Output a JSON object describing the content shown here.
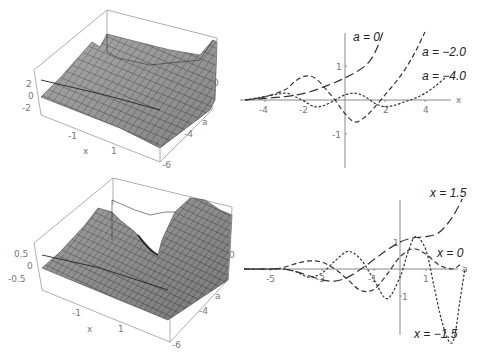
{
  "chart_data": [
    {
      "type": "surface",
      "title": "",
      "position": "top-left",
      "xlabel": "x",
      "ylabel": "a",
      "x_ticks": [
        "-1",
        "1"
      ],
      "a_ticks": [
        "0",
        "-2",
        "-4",
        "-6"
      ],
      "z_ticks": [
        "2",
        "0",
        "-2"
      ]
    },
    {
      "type": "line",
      "title": "",
      "position": "top-right",
      "xlabel": "x",
      "ylabel": "",
      "x_ticks": [
        "-4",
        "-2",
        "2",
        "4"
      ],
      "y_ticks": [
        "1",
        "-1"
      ],
      "xlim": [
        -5,
        5
      ],
      "ylim": [
        -1.9,
        2.0
      ],
      "series": [
        {
          "name": "a = 0",
          "style": "long-dash",
          "x": [
            -5,
            -4,
            -3,
            -2,
            -1,
            0,
            1,
            1.5,
            1.9
          ],
          "y": [
            0,
            0.05,
            0.1,
            0.2,
            0.4,
            0.65,
            1.0,
            1.4,
            2.0
          ]
        },
        {
          "name": "a = −2.0",
          "style": "medium-dash",
          "x": [
            -5,
            -4,
            -3,
            -2.5,
            -2,
            -1.5,
            -1,
            -0.5,
            0,
            0.5,
            1,
            1.5,
            2,
            2.5,
            3,
            3.5,
            4
          ],
          "y": [
            0,
            0.1,
            0.3,
            0.55,
            0.7,
            0.65,
            0.35,
            0,
            -0.4,
            -0.65,
            -0.5,
            -0.2,
            0.15,
            0.5,
            0.9,
            1.4,
            2.0
          ]
        },
        {
          "name": "a = −4.0",
          "style": "short-dash",
          "x": [
            -5,
            -4,
            -3,
            -2.5,
            -2,
            -1.5,
            -1,
            -0.5,
            0,
            0.5,
            1,
            1.5,
            2,
            2.5,
            3,
            3.5,
            4,
            4.5,
            5
          ],
          "y": [
            0,
            0.1,
            0.2,
            0.1,
            -0.05,
            -0.2,
            -0.15,
            0,
            0.15,
            0.2,
            0.1,
            -0.1,
            -0.2,
            -0.15,
            -0.05,
            0.05,
            0.2,
            0.4,
            0.65
          ]
        }
      ],
      "annotations": [
        "a = 0",
        "a = −2.0",
        "a = −4.0"
      ]
    },
    {
      "type": "surface",
      "title": "",
      "position": "bottom-left",
      "xlabel": "x",
      "ylabel": "a",
      "x_ticks": [
        "-1",
        "1"
      ],
      "a_ticks": [
        "0",
        "-2",
        "-4",
        "-6"
      ],
      "z_ticks": [
        "0.5",
        "0",
        "-0.5"
      ]
    },
    {
      "type": "line",
      "title": "",
      "position": "bottom-right",
      "xlabel": "a",
      "ylabel": "",
      "x_ticks": [
        "-5",
        "-3",
        "-1",
        "1"
      ],
      "y_ticks": [
        "1",
        "-1"
      ],
      "xlim": [
        -6,
        2.6
      ],
      "ylim": [
        -2.5,
        2.6
      ],
      "series": [
        {
          "name": "x = 1.5",
          "style": "long-dash",
          "x": [
            -6,
            -5,
            -4.5,
            -4,
            -3.5,
            -3,
            -2.5,
            -2,
            -1.5,
            -1,
            -0.5,
            0,
            0.5,
            1,
            1.5,
            2,
            2.4
          ],
          "y": [
            0,
            0,
            0,
            -0.1,
            -0.25,
            -0.4,
            -0.45,
            -0.3,
            0,
            0.35,
            0.7,
            1.0,
            1.15,
            1.2,
            1.35,
            1.9,
            2.6
          ]
        },
        {
          "name": "x = 0",
          "style": "medium-dash",
          "x": [
            -6,
            -5,
            -4.5,
            -4,
            -3.5,
            -3,
            -2.5,
            -2,
            -1.5,
            -1,
            -0.5,
            0,
            0.5,
            1,
            1.5,
            2,
            2.3
          ],
          "y": [
            0,
            0,
            0.05,
            0.2,
            0.3,
            0.25,
            0,
            -0.4,
            -0.8,
            -0.75,
            -0.2,
            0.45,
            0.75,
            0.55,
            0.15,
            0,
            0.15
          ]
        },
        {
          "name": "x = −1.5",
          "style": "short-dash",
          "x": [
            -6,
            -5,
            -4.5,
            -4,
            -3.5,
            -3,
            -2.5,
            -2,
            -1.5,
            -1,
            -0.5,
            0,
            0.3,
            0.6,
            1,
            1.3,
            1.6,
            1.9,
            2.1,
            2.3,
            2.5
          ],
          "y": [
            0,
            0,
            0,
            -0.1,
            -0.3,
            -0.15,
            0.3,
            0.65,
            0.35,
            -0.4,
            -1.1,
            -0.3,
            0.6,
            1.2,
            0.7,
            -0.6,
            -1.9,
            -2.7,
            -2.5,
            -1.2,
            0
          ]
        }
      ],
      "annotations": [
        "x = 1.5",
        "x = 0",
        "x = −1.5"
      ]
    }
  ],
  "labels": {
    "tl": {
      "z2": "2",
      "z0": "0",
      "zm2": "-2",
      "xm1": "-1",
      "x": "x",
      "x1": "1",
      "a0": "0",
      "am2": "-2",
      "a": "a",
      "am4": "-4",
      "am6": "-6"
    },
    "bl": {
      "z05": "0.5",
      "z0": "0",
      "zm05": "-0.5",
      "xm1": "-1",
      "x": "x",
      "x1": "1",
      "a0": "0",
      "am2": "-2",
      "a": "a",
      "am4": "-4",
      "am6": "-6"
    },
    "tr": {
      "xm4": "-4",
      "xm2": "-2",
      "x2": "2",
      "x4": "4",
      "y1": "1",
      "ym1": "-1",
      "xaxis": "x",
      "ann0": "a = 0",
      "ann2": "a = −2.0",
      "ann4": "a = −4.0"
    },
    "br": {
      "am5": "-5",
      "am3": "-3",
      "am1": "-1",
      "a1": "1",
      "y1": "1",
      "ym1": "1",
      "xaxis": "a",
      "ann15": "x = 1.5",
      "ann0": "x = 0",
      "annm15": "x = −1.5"
    }
  },
  "colors": {
    "surface": "#8a8a8a",
    "mesh": "#2e2e2e",
    "curve": "#333333",
    "axis": "#888888"
  }
}
